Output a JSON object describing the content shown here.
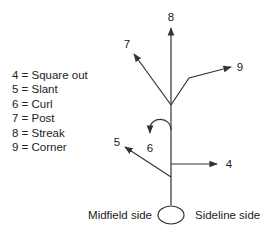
{
  "legend": {
    "items": [
      {
        "number": "4",
        "route": "Square out",
        "text": "4 = Square out"
      },
      {
        "number": "5",
        "route": "Slant",
        "text": "5 = Slant"
      },
      {
        "number": "6",
        "route": "Curl",
        "text": "6 = Curl"
      },
      {
        "number": "7",
        "route": "Post",
        "text": "7 = Post"
      },
      {
        "number": "8",
        "route": "Streak",
        "text": "8 = Streak"
      },
      {
        "number": "9",
        "route": "Corner",
        "text": "9 = Corner"
      }
    ]
  },
  "diagram": {
    "route_labels": {
      "square_out": "4",
      "slant": "5",
      "curl": "6",
      "post": "7",
      "streak": "8",
      "corner": "9"
    },
    "sides": {
      "left": "Midfield side",
      "right": "Sideline side"
    },
    "stroke_color": "#333333"
  }
}
